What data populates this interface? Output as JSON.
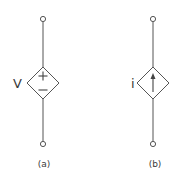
{
  "diagram": {
    "stroke_color": "#555555",
    "sources": [
      {
        "id": "a",
        "type": "dependent-voltage-source",
        "variable": "V",
        "symbol_top": "+",
        "symbol_bottom": "−",
        "caption": "(a)"
      },
      {
        "id": "b",
        "type": "dependent-current-source",
        "variable": "i",
        "symbol": "arrow-up",
        "caption": "(b)"
      }
    ]
  }
}
